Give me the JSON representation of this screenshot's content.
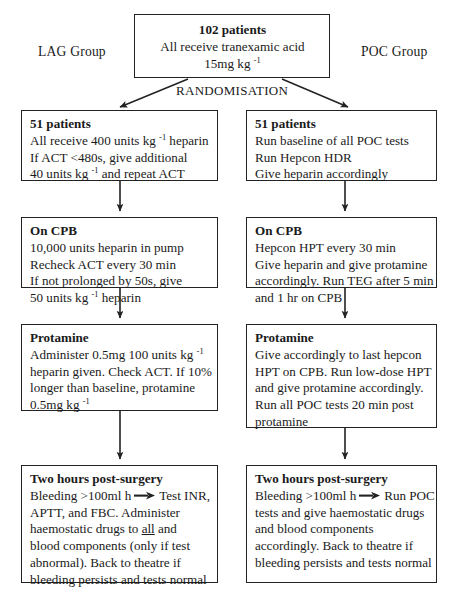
{
  "diagram": {
    "title_box": {
      "name": "102 patients",
      "line1": "102 patients",
      "line2": "All receive tranexamic acid",
      "line3_pre": "15mg kg ",
      "line3_sup": "-1"
    },
    "group_labels": {
      "left": "LAG Group",
      "right": "POC Group"
    },
    "randomisation_label": "RANDOMISATION",
    "left_column": [
      {
        "id": "lag-patients",
        "header": "51 patients",
        "lines": [
          {
            "pre": "All receive 400 units kg ",
            "sup": "-1",
            "post": " heparin"
          },
          {
            "pre": "If ACT <480s, give additional",
            "sup": "",
            "post": ""
          },
          {
            "pre": "40 units kg ",
            "sup": "-1",
            "post": " and repeat ACT"
          }
        ]
      },
      {
        "id": "lag-on-cpb",
        "header": "On CPB",
        "lines": [
          {
            "pre": "10,000 units heparin in pump",
            "sup": "",
            "post": ""
          },
          {
            "pre": "Recheck ACT every 30 min",
            "sup": "",
            "post": ""
          },
          {
            "pre": "If not prolonged by 50s, give",
            "sup": "",
            "post": ""
          },
          {
            "pre": "50 units kg ",
            "sup": "-1",
            "post": " heparin"
          }
        ]
      },
      {
        "id": "lag-protamine",
        "header": "Protamine",
        "lines": [
          {
            "pre": "Administer 0.5mg 100 units kg ",
            "sup": "-1",
            "post": ""
          },
          {
            "pre": "heparin given. Check ACT. If 10%",
            "sup": "",
            "post": ""
          },
          {
            "pre": "longer than baseline, protamine",
            "sup": "",
            "post": ""
          },
          {
            "pre": "0.5mg kg ",
            "sup": "-1",
            "post": ""
          }
        ]
      }
    ],
    "right_column": [
      {
        "id": "poc-patients",
        "header": "51 patients",
        "lines": [
          {
            "pre": "Run baseline of all POC tests",
            "sup": "",
            "post": ""
          },
          {
            "pre": "Run Hepcon HDR",
            "sup": "",
            "post": ""
          },
          {
            "pre": "Give heparin accordingly",
            "sup": "",
            "post": ""
          }
        ]
      },
      {
        "id": "poc-on-cpb",
        "header": "On CPB",
        "lines": [
          {
            "pre": "Hepcon HPT every 30 min",
            "sup": "",
            "post": ""
          },
          {
            "pre": "Give heparin and give protamine",
            "sup": "",
            "post": ""
          },
          {
            "pre": "accordingly. Run TEG after 5 min",
            "sup": "",
            "post": ""
          },
          {
            "pre": "and 1 hr on CPB",
            "sup": "",
            "post": ""
          }
        ]
      },
      {
        "id": "poc-protamine",
        "header": "Protamine",
        "lines": [
          {
            "pre": "Give accordingly to last hepcon",
            "sup": "",
            "post": ""
          },
          {
            "pre": "HPT on CPB. Run low-dose HPT",
            "sup": "",
            "post": ""
          },
          {
            "pre": "and give protamine accordingly.",
            "sup": "",
            "post": ""
          },
          {
            "pre": "Run all POC tests 20 min post",
            "sup": "",
            "post": ""
          },
          {
            "pre": "protamine",
            "sup": "",
            "post": ""
          }
        ]
      }
    ],
    "left_outcome": {
      "id": "lag-outcome",
      "header": "Two hours post-surgery",
      "seg_before_arrow": "Bleeding >100ml h",
      "seg_after_arrow": "Test INR,",
      "rest_a": "APTT, and FBC. Administer",
      "rest_b_pre": "haemostatic drugs to ",
      "rest_b_underline": "all",
      "rest_b_post": " and",
      "rest_c": "blood components (only if test",
      "rest_d": "abnormal). Back to theatre if",
      "rest_e": "bleeding persists and tests normal"
    },
    "right_outcome": {
      "id": "poc-outcome",
      "header": "Two hours post-surgery",
      "seg_before_arrow": "Bleeding >100ml h",
      "seg_after_arrow": "Run POC",
      "rest_a": "tests and give haemostatic drugs",
      "rest_b": "and blood components",
      "rest_c": "accordingly.  Back to theatre if",
      "rest_d": "bleeding persists and tests normal"
    },
    "colors": {
      "line": "#222222",
      "text": "#1a1a1a",
      "background": "#ffffff"
    }
  }
}
